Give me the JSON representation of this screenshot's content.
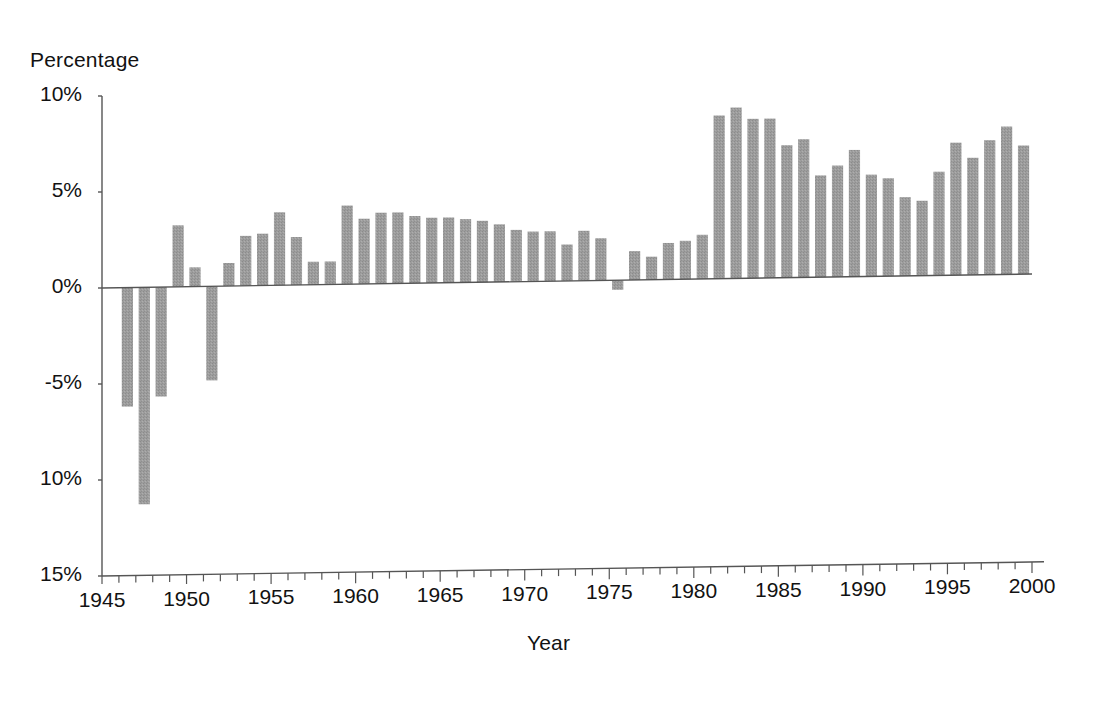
{
  "chart_data": {
    "type": "bar",
    "title": "",
    "subtitle": "",
    "xlabel": "Year",
    "ylabel": "Percentage",
    "ylim": [
      -15,
      10
    ],
    "xlim": [
      1945,
      2000
    ],
    "grid": false,
    "legend": null,
    "bar_color": "#9a9a9a",
    "axis_color": "#555555",
    "y_tick_labels": [
      "10%",
      "5%",
      "0%",
      "-5%",
      "10%",
      "15%"
    ],
    "y_tick_values": [
      10,
      5,
      0,
      -5,
      -10,
      -15
    ],
    "x_tick_labels": [
      "1945",
      "1950",
      "1955",
      "1960",
      "1965",
      "1970",
      "1975",
      "1980",
      "1985",
      "1990",
      "1995",
      "2000"
    ],
    "x_tick_values": [
      1945,
      1950,
      1955,
      1960,
      1965,
      1970,
      1975,
      1980,
      1985,
      1990,
      1995,
      2000
    ],
    "x_minor_tick_interval": 1,
    "categories": [
      1946,
      1947,
      1948,
      1949,
      1950,
      1951,
      1952,
      1953,
      1954,
      1955,
      1956,
      1957,
      1958,
      1959,
      1960,
      1961,
      1962,
      1963,
      1964,
      1965,
      1966,
      1967,
      1968,
      1969,
      1970,
      1971,
      1972,
      1973,
      1974,
      1975,
      1976,
      1977,
      1978,
      1979,
      1980,
      1981,
      1982,
      1983,
      1984,
      1985,
      1986,
      1987,
      1988,
      1989,
      1990,
      1991,
      1992,
      1993,
      1994,
      1995,
      1996,
      1997,
      1998,
      1999
    ],
    "values": [
      -6.2,
      -11.3,
      -5.7,
      3.2,
      1.0,
      -4.9,
      1.2,
      2.6,
      2.7,
      3.8,
      2.5,
      1.2,
      1.2,
      4.1,
      3.4,
      3.7,
      3.7,
      3.5,
      3.4,
      3.4,
      3.3,
      3.2,
      3.0,
      2.7,
      2.6,
      2.6,
      1.9,
      2.6,
      2.2,
      -0.5,
      1.5,
      1.2,
      1.9,
      2.0,
      2.3,
      8.5,
      8.9,
      8.3,
      8.3,
      6.9,
      7.2,
      5.3,
      5.8,
      6.6,
      5.3,
      5.1,
      4.1,
      3.9,
      5.4,
      6.9,
      6.1,
      7.0,
      7.7,
      6.7
    ],
    "annotations": []
  },
  "figure": {
    "ylabel_title": "Percentage",
    "xlabel_title": "Year"
  }
}
